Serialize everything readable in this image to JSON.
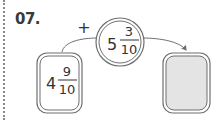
{
  "problem": {
    "number": "07.",
    "operator": "+",
    "operand": {
      "whole": "5",
      "numerator": "3",
      "denominator": "10"
    },
    "start": {
      "whole": "4",
      "numerator": "9",
      "denominator": "10"
    },
    "answer": {
      "whole": "",
      "numerator": "",
      "denominator": ""
    }
  },
  "colors": {
    "stroke": "#6f6f6f",
    "answer_fill": "#e4e4e4",
    "text": "#333333"
  }
}
